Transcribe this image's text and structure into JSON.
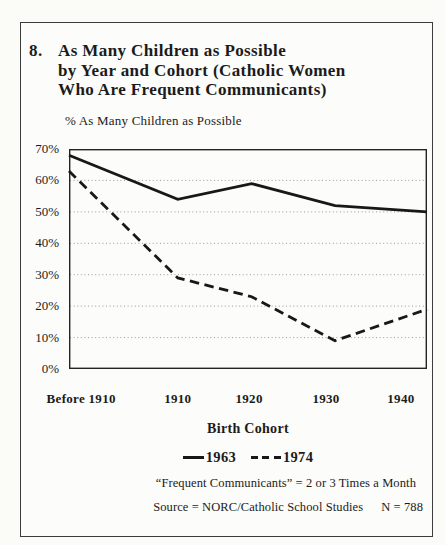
{
  "figure": {
    "number": "8.",
    "title_lines": [
      "As Many Children as Possible",
      "by Year and Cohort (Catholic Women",
      "Who Are Frequent Communicants)"
    ]
  },
  "chart_data": {
    "type": "line",
    "ylabel": "% As Many Children as Possible",
    "xlabel": "Birth Cohort",
    "categories": [
      "Before 1910",
      "1910",
      "1920",
      "1930",
      "1940"
    ],
    "series": [
      {
        "name": "1963",
        "line_style": "solid",
        "values": [
          68,
          54,
          59,
          52,
          50
        ]
      },
      {
        "name": "1974",
        "line_style": "dashed",
        "values": [
          63,
          29,
          23,
          9,
          19
        ]
      }
    ],
    "ylim": [
      0,
      70
    ],
    "ytick_labels": [
      "70%",
      "60%",
      "50%",
      "40%",
      "30%",
      "20%",
      "10%",
      "0%"
    ],
    "grid": "horizontal-dotted",
    "legend_position": "below"
  },
  "legend": {
    "entries": [
      {
        "label": "1963",
        "style": "solid"
      },
      {
        "label": "1974",
        "style": "dashed"
      }
    ]
  },
  "footnotes": {
    "line1": "“Frequent Communicants” = 2 or 3 Times a Month",
    "line2": "Source = NORC/Catholic School Studies",
    "n": "N = 788"
  },
  "colors": {
    "line": "#181818",
    "plot_border": "#242424",
    "grid": "#9a9a9a",
    "box_border": "#3c3c3c",
    "background": "#fcfcfa"
  }
}
